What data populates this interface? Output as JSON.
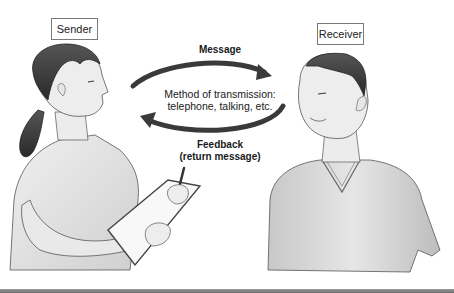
{
  "diagram": {
    "participants": {
      "sender": {
        "label": "Sender"
      },
      "receiver": {
        "label": "Receiver"
      }
    },
    "flows": {
      "message": {
        "label": "Message",
        "direction": "sender-to-receiver"
      },
      "feedback": {
        "label": "Feedback",
        "sublabel": "(return message)",
        "direction": "receiver-to-sender"
      }
    },
    "channel": {
      "line1": "Method of transmission:",
      "line2": "telephone, talking, etc."
    },
    "nodes": [
      "Sender",
      "Receiver"
    ],
    "edges": [
      {
        "from": "Sender",
        "to": "Receiver",
        "label": "Message"
      },
      {
        "from": "Receiver",
        "to": "Sender",
        "label": "Feedback (return message)"
      }
    ],
    "colors": {
      "arrow": "#3a3a3a",
      "box_border": "#7a7a7a",
      "hair": "#3c3c3c",
      "skin": "#ededed",
      "shirt": "#d8d8d8"
    }
  }
}
